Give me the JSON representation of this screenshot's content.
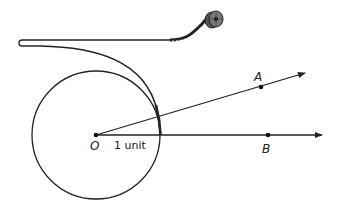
{
  "diagram": {
    "labels": {
      "center": "O",
      "point_a": "A",
      "point_b": "B",
      "radius": "1 unit"
    },
    "colors": {
      "stroke": "#222222",
      "background": "#ffffff"
    }
  }
}
